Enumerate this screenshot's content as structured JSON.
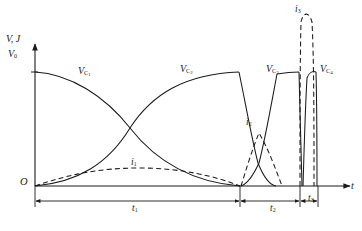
{
  "figure": {
    "type": "waveform-diagram",
    "axes": {
      "y_label": "V, J",
      "y_origin_label": "V",
      "y_origin_sub": "0",
      "x_label": "t",
      "origin_label": "O"
    },
    "curve_labels": [
      {
        "name": "vc1-label",
        "base": "V",
        "sub": "C",
        "subsub": "1",
        "x": 78,
        "y": 65
      },
      {
        "name": "vc2-label",
        "base": "V",
        "sub": "C",
        "subsub": "2",
        "x": 180,
        "y": 63
      },
      {
        "name": "vc3-label",
        "base": "V",
        "sub": "C",
        "subsub": "3",
        "x": 266,
        "y": 63
      },
      {
        "name": "vc4-label",
        "base": "V",
        "sub": "C",
        "subsub": "4",
        "x": 320,
        "y": 63
      }
    ],
    "current_labels": [
      {
        "name": "i1-label",
        "base": "i",
        "sub": "1",
        "x": 131,
        "y": 157
      },
      {
        "name": "i2-label",
        "base": "i",
        "sub": "2",
        "x": 246,
        "y": 117
      },
      {
        "name": "i3-label",
        "base": "i",
        "sub": "3",
        "x": 295,
        "y": 4
      }
    ],
    "interval_labels": [
      {
        "name": "t1-interval-label",
        "base": "t",
        "sub": "1",
        "x": 132,
        "y": 203
      },
      {
        "name": "t2-interval-label",
        "base": "t",
        "sub": "2",
        "x": 270,
        "y": 203
      },
      {
        "name": "t3-interval-label",
        "base": "t",
        "sub": "3",
        "x": 308,
        "y": 193
      }
    ],
    "colors": {
      "stroke": "#1a1a1a",
      "background": "#ffffff"
    },
    "geometry": {
      "origin_x": 35,
      "baseline_y": 186,
      "top_y": 40,
      "v0_y": 72,
      "t1_end_x": 240,
      "t2_end_x": 300,
      "t3_end_x": 318,
      "axis_end_x": 352
    }
  },
  "chart_data": {
    "type": "line",
    "title": "",
    "xlabel": "t",
    "ylabel": "V, J",
    "series": [
      {
        "name": "V_C1",
        "style": "solid",
        "description": "decays from V0 to 0 across t1"
      },
      {
        "name": "V_C2",
        "style": "solid",
        "description": "rises from 0 to V0 across t1, then decays in t2"
      },
      {
        "name": "V_C3",
        "style": "solid",
        "description": "rises during t2, narrow pulse at t3"
      },
      {
        "name": "V_C4",
        "style": "solid",
        "description": "narrow pulse at end of t3"
      },
      {
        "name": "i1",
        "style": "dashed",
        "description": "low broad hump over t1"
      },
      {
        "name": "i2",
        "style": "dashed",
        "description": "hump over t2"
      },
      {
        "name": "i3",
        "style": "dashed",
        "description": "tall narrow spike over t3"
      }
    ]
  }
}
